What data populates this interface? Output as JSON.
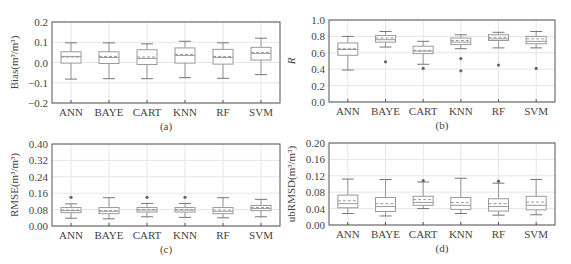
{
  "chart_data": [
    {
      "id": "a",
      "type": "box",
      "caption": "(a)",
      "title": "",
      "xlabel": "",
      "ylabel": "Bias(m³/m³)",
      "ylim": [
        -0.2,
        0.2
      ],
      "yticks": [
        -0.2,
        -0.1,
        0.0,
        0.1,
        0.2
      ],
      "ytick_labels": [
        "−0.2",
        "−0.1",
        "0.0",
        "0.1",
        "0.2"
      ],
      "grid": true,
      "categories": [
        "ANN",
        "BAYE",
        "CART",
        "KNN",
        "RF",
        "SVM"
      ],
      "boxes": [
        {
          "name": "ANN",
          "whislo": -0.082,
          "q1": -0.003,
          "med": 0.03,
          "mean": 0.027,
          "q3": 0.053,
          "whishi": 0.097,
          "fliers": []
        },
        {
          "name": "BAYE",
          "whislo": -0.08,
          "q1": -0.005,
          "med": 0.025,
          "mean": 0.03,
          "q3": 0.053,
          "whishi": 0.097,
          "fliers": []
        },
        {
          "name": "CART",
          "whislo": -0.08,
          "q1": -0.01,
          "med": 0.02,
          "mean": 0.027,
          "q3": 0.063,
          "whishi": 0.092,
          "fliers": []
        },
        {
          "name": "KNN",
          "whislo": -0.075,
          "q1": -0.003,
          "med": 0.035,
          "mean": 0.04,
          "q3": 0.072,
          "whishi": 0.105,
          "fliers": []
        },
        {
          "name": "RF",
          "whislo": -0.078,
          "q1": -0.008,
          "med": 0.025,
          "mean": 0.03,
          "q3": 0.065,
          "whishi": 0.097,
          "fliers": []
        },
        {
          "name": "SVM",
          "whislo": -0.06,
          "q1": 0.012,
          "med": 0.045,
          "mean": 0.05,
          "q3": 0.075,
          "whishi": 0.12,
          "fliers": []
        }
      ]
    },
    {
      "id": "b",
      "type": "box",
      "caption": "(b)",
      "title": "",
      "xlabel": "",
      "ylabel": "R",
      "ylim": [
        0.0,
        1.0
      ],
      "yticks": [
        0.0,
        0.2,
        0.4,
        0.6,
        0.8,
        1.0
      ],
      "ytick_labels": [
        "0.0",
        "0.2",
        "0.4",
        "0.6",
        "0.8",
        "1.0"
      ],
      "grid": true,
      "categories": [
        "ANN",
        "BAYE",
        "CART",
        "KNN",
        "RF",
        "SVM"
      ],
      "boxes": [
        {
          "name": "ANN",
          "whislo": 0.39,
          "q1": 0.57,
          "med": 0.64,
          "mean": 0.65,
          "q3": 0.72,
          "whishi": 0.8,
          "fliers": []
        },
        {
          "name": "BAYE",
          "whislo": 0.67,
          "q1": 0.73,
          "med": 0.76,
          "mean": 0.78,
          "q3": 0.81,
          "whishi": 0.86,
          "fliers": [
            0.49
          ]
        },
        {
          "name": "CART",
          "whislo": 0.46,
          "q1": 0.59,
          "med": 0.62,
          "mean": 0.63,
          "q3": 0.68,
          "whishi": 0.74,
          "fliers": [
            0.41
          ]
        },
        {
          "name": "KNN",
          "whislo": 0.65,
          "q1": 0.7,
          "med": 0.73,
          "mean": 0.75,
          "q3": 0.78,
          "whishi": 0.82,
          "fliers": [
            0.53,
            0.38
          ]
        },
        {
          "name": "RF",
          "whislo": 0.66,
          "q1": 0.75,
          "med": 0.77,
          "mean": 0.79,
          "q3": 0.82,
          "whishi": 0.85,
          "fliers": [
            0.45
          ]
        },
        {
          "name": "SVM",
          "whislo": 0.66,
          "q1": 0.71,
          "med": 0.74,
          "mean": 0.77,
          "q3": 0.8,
          "whishi": 0.86,
          "fliers": [
            0.41
          ]
        }
      ]
    },
    {
      "id": "c",
      "type": "box",
      "caption": "(c)",
      "title": "",
      "xlabel": "",
      "ylabel": "RMSE(m³/m³)",
      "ylim": [
        0.0,
        0.4
      ],
      "yticks": [
        0.0,
        0.08,
        0.16,
        0.24,
        0.32,
        0.4
      ],
      "ytick_labels": [
        "0.00",
        "0.08",
        "0.16",
        "0.24",
        "0.32",
        "0.40"
      ],
      "grid": true,
      "categories": [
        "ANN",
        "BAYE",
        "CART",
        "KNN",
        "RF",
        "SVM"
      ],
      "boxes": [
        {
          "name": "ANN",
          "whislo": 0.038,
          "q1": 0.065,
          "med": 0.075,
          "mean": 0.078,
          "q3": 0.09,
          "whishi": 0.108,
          "fliers": [
            0.14
          ]
        },
        {
          "name": "BAYE",
          "whislo": 0.035,
          "q1": 0.06,
          "med": 0.072,
          "mean": 0.075,
          "q3": 0.09,
          "whishi": 0.138,
          "fliers": []
        },
        {
          "name": "CART",
          "whislo": 0.045,
          "q1": 0.068,
          "med": 0.078,
          "mean": 0.08,
          "q3": 0.09,
          "whishi": 0.11,
          "fliers": [
            0.14
          ]
        },
        {
          "name": "KNN",
          "whislo": 0.042,
          "q1": 0.068,
          "med": 0.078,
          "mean": 0.08,
          "q3": 0.09,
          "whishi": 0.11,
          "fliers": [
            0.14
          ]
        },
        {
          "name": "RF",
          "whislo": 0.04,
          "q1": 0.06,
          "med": 0.072,
          "mean": 0.078,
          "q3": 0.09,
          "whishi": 0.138,
          "fliers": []
        },
        {
          "name": "SVM",
          "whislo": 0.045,
          "q1": 0.075,
          "med": 0.085,
          "mean": 0.09,
          "q3": 0.1,
          "whishi": 0.13,
          "fliers": []
        }
      ]
    },
    {
      "id": "d",
      "type": "box",
      "caption": "(d)",
      "title": "",
      "xlabel": "",
      "ylabel": "ubRMSD(m³/m³)",
      "ylim": [
        0.0,
        0.2
      ],
      "yticks": [
        0.0,
        0.04,
        0.08,
        0.12,
        0.16,
        0.2
      ],
      "ytick_labels": [
        "0.00",
        "0.04",
        "0.08",
        "0.12",
        "0.16",
        "0.20"
      ],
      "grid": true,
      "categories": [
        "ANN",
        "BAYE",
        "CART",
        "KNN",
        "RF",
        "SVM"
      ],
      "boxes": [
        {
          "name": "ANN",
          "whislo": 0.028,
          "q1": 0.042,
          "med": 0.052,
          "mean": 0.059,
          "q3": 0.073,
          "whishi": 0.112,
          "fliers": []
        },
        {
          "name": "BAYE",
          "whislo": 0.022,
          "q1": 0.033,
          "med": 0.045,
          "mean": 0.052,
          "q3": 0.067,
          "whishi": 0.111,
          "fliers": []
        },
        {
          "name": "CART",
          "whislo": 0.04,
          "q1": 0.048,
          "med": 0.055,
          "mean": 0.062,
          "q3": 0.07,
          "whishi": 0.105,
          "fliers": [
            0.108
          ]
        },
        {
          "name": "KNN",
          "whislo": 0.028,
          "q1": 0.038,
          "med": 0.048,
          "mean": 0.055,
          "q3": 0.067,
          "whishi": 0.114,
          "fliers": []
        },
        {
          "name": "RF",
          "whislo": 0.024,
          "q1": 0.034,
          "med": 0.045,
          "mean": 0.052,
          "q3": 0.064,
          "whishi": 0.102,
          "fliers": [
            0.107
          ]
        },
        {
          "name": "SVM",
          "whislo": 0.025,
          "q1": 0.037,
          "med": 0.048,
          "mean": 0.056,
          "q3": 0.07,
          "whishi": 0.111,
          "fliers": []
        }
      ]
    }
  ],
  "style": {
    "box_color": "#9a9a9a",
    "grid_color": "#e6e6e6",
    "frame_color": "#555555",
    "flier_color": "#666666",
    "text_color": "#444444"
  }
}
